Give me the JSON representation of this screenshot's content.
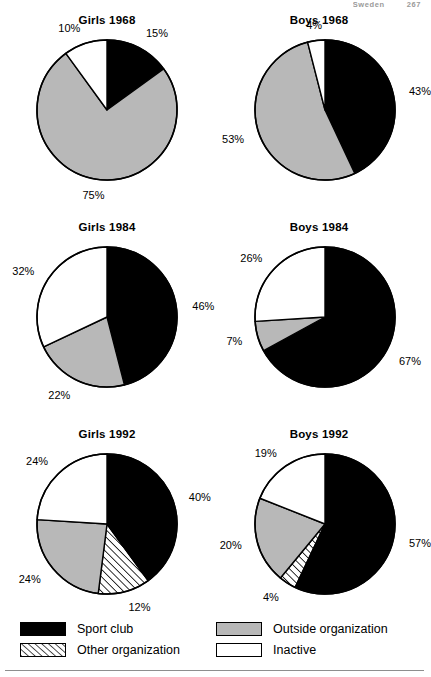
{
  "header": {
    "country": "Sweden",
    "page_number": "267"
  },
  "legend": {
    "items": [
      {
        "label": "Sport club",
        "fill": "black",
        "color": "#000000"
      },
      {
        "label": "Outside organization",
        "fill": "gray",
        "color": "#b8b8b8"
      },
      {
        "label": "Other organization",
        "fill": "hatch",
        "color": "#ffffff"
      },
      {
        "label": "Inactive",
        "fill": "white",
        "color": "#ffffff"
      }
    ]
  },
  "chart_data": {
    "type": "pie",
    "title": "",
    "unit": "%",
    "categories": [
      "Sport club",
      "Other organization",
      "Outside organization",
      "Inactive"
    ],
    "colors": {
      "sport_club": "#000000",
      "other_organization": "#ffffff",
      "outside_organization": "#b8b8b8",
      "inactive": "#ffffff"
    },
    "charts": [
      {
        "title": "Girls 1968",
        "slices": [
          {
            "label": "Sport club",
            "value": 15,
            "text": "15%",
            "fill": "black"
          },
          {
            "label": "Outside organization",
            "value": 75,
            "text": "75%",
            "fill": "gray"
          },
          {
            "label": "Inactive",
            "value": 10,
            "text": "10%",
            "fill": "white"
          }
        ]
      },
      {
        "title": "Boys 1968",
        "slices": [
          {
            "label": "Sport club",
            "value": 43,
            "text": "43%",
            "fill": "black"
          },
          {
            "label": "Outside organization",
            "value": 53,
            "text": "53%",
            "fill": "gray"
          },
          {
            "label": "Inactive",
            "value": 4,
            "text": "4%",
            "fill": "white"
          }
        ]
      },
      {
        "title": "Girls 1984",
        "slices": [
          {
            "label": "Sport club",
            "value": 46,
            "text": "46%",
            "fill": "black"
          },
          {
            "label": "Outside organization",
            "value": 22,
            "text": "22%",
            "fill": "gray"
          },
          {
            "label": "Inactive",
            "value": 32,
            "text": "32%",
            "fill": "white"
          }
        ]
      },
      {
        "title": "Boys 1984",
        "slices": [
          {
            "label": "Sport club",
            "value": 67,
            "text": "67%",
            "fill": "black"
          },
          {
            "label": "Outside organization",
            "value": 7,
            "text": "7%",
            "fill": "gray"
          },
          {
            "label": "Inactive",
            "value": 26,
            "text": "26%",
            "fill": "white"
          }
        ]
      },
      {
        "title": "Girls 1992",
        "slices": [
          {
            "label": "Sport club",
            "value": 40,
            "text": "40%",
            "fill": "black"
          },
          {
            "label": "Other organization",
            "value": 12,
            "text": "12%",
            "fill": "hatch"
          },
          {
            "label": "Outside organization",
            "value": 24,
            "text": "24%",
            "fill": "gray"
          },
          {
            "label": "Inactive",
            "value": 24,
            "text": "24%",
            "fill": "white"
          }
        ]
      },
      {
        "title": "Boys 1992",
        "slices": [
          {
            "label": "Sport club",
            "value": 57,
            "text": "57%",
            "fill": "black"
          },
          {
            "label": "Other organization",
            "value": 4,
            "text": "4%",
            "fill": "hatch"
          },
          {
            "label": "Outside organization",
            "value": 20,
            "text": "20%",
            "fill": "gray"
          },
          {
            "label": "Inactive",
            "value": 19,
            "text": "19%",
            "fill": "white"
          }
        ]
      }
    ]
  }
}
